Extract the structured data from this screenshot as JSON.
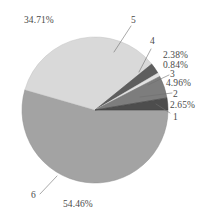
{
  "title": "",
  "background_color": "#ffffff",
  "chart_data": {
    "type": "pie",
    "title": "",
    "xlabel": "",
    "ylabel": "",
    "legend": "none",
    "grid": false,
    "labels_show_percent": true,
    "categories": [
      "1",
      "2",
      "3",
      "4",
      "5",
      "6"
    ],
    "values": [
      2.65,
      4.96,
      0.84,
      2.38,
      34.71,
      54.46
    ],
    "value_labels": [
      "2.65%",
      "4.96%",
      "0.84%",
      "2.38%",
      "34.71%",
      "54.46%"
    ],
    "colors": [
      "#4d4d4d",
      "#7d7d7d",
      "#e2e2e2",
      "#5e5e5e",
      "#d9d9d9",
      "#a3a3a3"
    ],
    "units": "percent",
    "start_angle_deg": 0,
    "direction": "counterclockwise",
    "slices": [
      {
        "key": "1",
        "label": "1",
        "percent_label": "2.65%",
        "value": 2.65,
        "color": "#4d4d4d"
      },
      {
        "key": "2",
        "label": "2",
        "percent_label": "4.96%",
        "value": 4.96,
        "color": "#7d7d7d"
      },
      {
        "key": "3",
        "label": "3",
        "percent_label": "0.84%",
        "value": 0.84,
        "color": "#e2e2e2"
      },
      {
        "key": "4",
        "label": "4",
        "percent_label": "2.38%",
        "value": 2.38,
        "color": "#5e5e5e"
      },
      {
        "key": "5",
        "label": "5",
        "percent_label": "34.71%",
        "value": 34.71,
        "color": "#d9d9d9"
      },
      {
        "key": "6",
        "label": "6",
        "percent_label": "54.46%",
        "value": 54.46,
        "color": "#a3a3a3"
      }
    ]
  },
  "annotations": {
    "pct_5": "34.71%",
    "idx_5": "5",
    "idx_4": "4",
    "pct_4": "2.38%",
    "pct_3": "0.84%",
    "idx_3": "3",
    "pct_2": "4.96%",
    "idx_2": "2",
    "pct_1": "2.65%",
    "idx_1": "1",
    "idx_6": "6",
    "pct_6": "54.46%"
  }
}
